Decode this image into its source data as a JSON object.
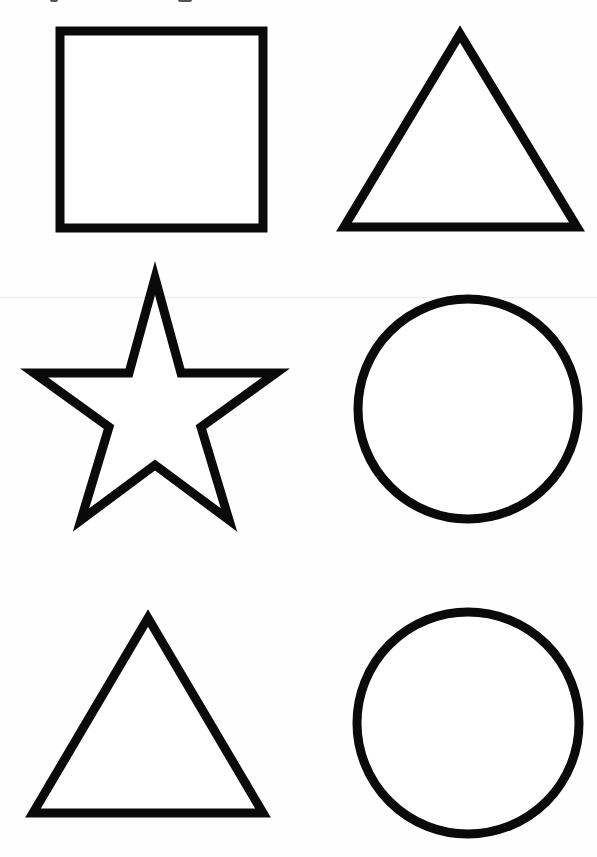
{
  "worksheet": {
    "background": "#ffffff",
    "stroke_color": "#0a0a0a",
    "stroke_width": 9,
    "layout": "3 rows x 2 columns",
    "shapes": [
      {
        "row": 1,
        "col": 1,
        "type": "square",
        "label": "square"
      },
      {
        "row": 1,
        "col": 2,
        "type": "triangle",
        "label": "triangle"
      },
      {
        "row": 2,
        "col": 1,
        "type": "star",
        "label": "star"
      },
      {
        "row": 2,
        "col": 2,
        "type": "circle",
        "label": "circle"
      },
      {
        "row": 3,
        "col": 1,
        "type": "triangle",
        "label": "triangle"
      },
      {
        "row": 3,
        "col": 2,
        "type": "circle",
        "label": "circle"
      }
    ]
  }
}
